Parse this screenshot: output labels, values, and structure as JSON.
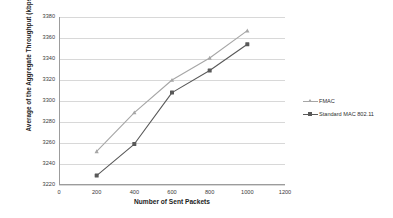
{
  "chart_data": {
    "type": "line",
    "title": "",
    "xlabel": "Number of Sent Packets",
    "ylabel": "Average of the Aggregate Throughput (kbps)",
    "x": [
      200,
      400,
      600,
      800,
      1000
    ],
    "xlim": [
      0,
      1200
    ],
    "ylim": [
      3220,
      3380
    ],
    "xticks": [
      "0",
      "200",
      "400",
      "600",
      "800",
      "1000",
      "1200"
    ],
    "yticks": [
      "3220",
      "3240",
      "3260",
      "3280",
      "3300",
      "3320",
      "3340",
      "3360",
      "3380"
    ],
    "grid": "horizontal",
    "legend_position": "right",
    "series": [
      {
        "name": "FMAC",
        "values": [
          3252,
          3289,
          3320,
          3341,
          3367
        ],
        "color": "#a6a6a6",
        "marker": "triangle"
      },
      {
        "name": "Standard MAC 802.11",
        "values": [
          3229,
          3259,
          3308,
          3329,
          3354
        ],
        "color": "#595959",
        "marker": "square"
      }
    ]
  },
  "legend": {
    "entries": [
      {
        "label": "FMAC"
      },
      {
        "label": "Standard MAC 802.11"
      }
    ]
  }
}
